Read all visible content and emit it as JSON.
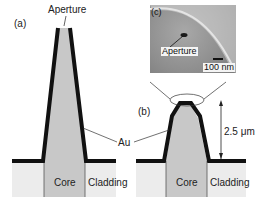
{
  "figure": {
    "panels": [
      {
        "id": "a",
        "label": "(a)",
        "description": "Sharp tapered fiber probe coated with Au"
      },
      {
        "id": "b",
        "label": "(b)",
        "description": "Blunt triple-tapered probe coated with Au"
      },
      {
        "id": "c",
        "label": "(c)",
        "description": "SEM image of aperture region"
      }
    ],
    "labels": {
      "panel_a": "(a)",
      "panel_b": "(b)",
      "panel_c": "(c)",
      "aperture_a": "Aperture",
      "aperture_c": "Aperture",
      "au": "Au",
      "height": "2.5 μm",
      "scale_bar": "100 nm",
      "core_a": "Core",
      "cladding_a": "Cladding",
      "core_b": "Core",
      "cladding_b": "Cladding"
    },
    "colors": {
      "coating": "#111111",
      "core": "#c8c8c8",
      "cladding": "#ececec",
      "sem_background": "#8e8e8e",
      "sem_edge": "#f0f0f0"
    }
  }
}
